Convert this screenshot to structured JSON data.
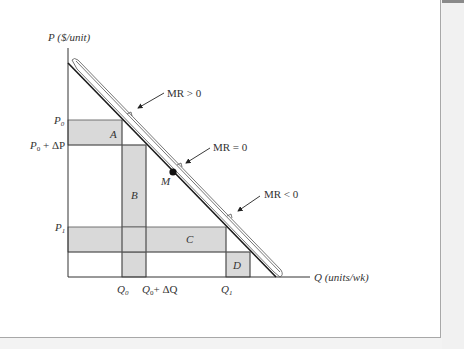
{
  "diagram": {
    "y_axis_label": "P ($/unit)",
    "x_axis_label": "Q (units/wk)",
    "price_labels": {
      "p0": "P",
      "p0_sub": "0",
      "p0dp": "P",
      "p0dp_sub": "0",
      "p0dp_rest": " + ΔP",
      "p1": "P",
      "p1_sub": "1"
    },
    "quantity_labels": {
      "q0": "Q",
      "q0_sub": "0",
      "q0dq": "Q",
      "q0dq_sub": "0",
      "q0dq_rest": "+ ΔQ",
      "q1": "Q",
      "q1_sub": "1"
    },
    "regions": {
      "a": "A",
      "b": "B",
      "c": "C",
      "d": "D"
    },
    "point_label": "M",
    "annotations": {
      "mr_pos": "MR > 0",
      "mr_zero": "MR = 0",
      "mr_neg": "MR < 0"
    },
    "colors": {
      "shade": "#d9d9d9",
      "line": "#1a1a1a",
      "axis": "#333333"
    }
  }
}
